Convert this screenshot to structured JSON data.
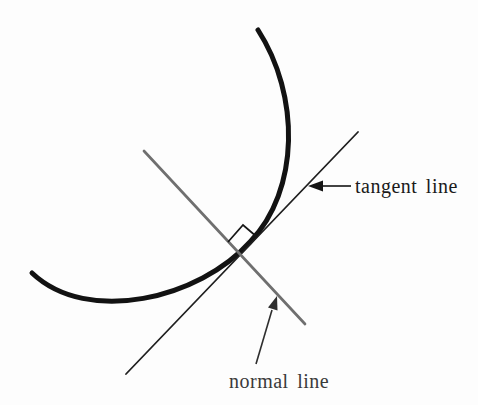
{
  "figure": {
    "canvas": {
      "width": 478,
      "height": 405,
      "background": "#fdfdfd"
    },
    "curve": {
      "path": "M 258 30 C 300 95 300 190 250 242 C 200 298 88 326 32 273",
      "color": "#121212",
      "stroke_width": 5
    },
    "tangent_line": {
      "x1": 126,
      "y1": 374,
      "x2": 358,
      "y2": 132,
      "color": "#1f1f1f",
      "stroke_width": 1.8
    },
    "normal_line": {
      "x1": 144,
      "y1": 151,
      "x2": 305,
      "y2": 324,
      "color": "#6f6f6f",
      "stroke_width": 2.7
    },
    "right_angle_marker": {
      "points": "228,242 243,225 257,237",
      "color": "#161616",
      "stroke_width": 1.7
    },
    "tangent_label": {
      "text": "tangent line",
      "x": 355,
      "y": 193,
      "color": "#1a1a1a",
      "font_size": 20
    },
    "normal_label": {
      "text": "normal line",
      "x": 229,
      "y": 388,
      "color": "#3a3a3a",
      "font_size": 20
    },
    "tangent_arrow": {
      "shaft": {
        "x1": 351,
        "y1": 186,
        "x2": 320,
        "y2": 186
      },
      "head_points": "308,186 323,180.5 323,191.5",
      "color": "#141414",
      "stroke_width": 1.6
    },
    "normal_arrow": {
      "shaft": {
        "x1": 256,
        "y1": 364,
        "x2": 272,
        "y2": 310
      },
      "head_points": "277,296 277.5,310.5 268,307.5",
      "color": "#2e2e2e",
      "stroke_width": 1.6
    }
  }
}
